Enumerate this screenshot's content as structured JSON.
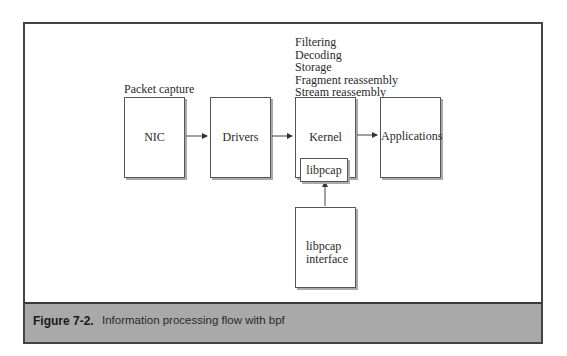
{
  "diagram": {
    "nodes": [
      {
        "id": "nic",
        "label": "NIC"
      },
      {
        "id": "drivers",
        "label": "Drivers"
      },
      {
        "id": "kernel",
        "label": "Kernel"
      },
      {
        "id": "applications",
        "label": "Applications"
      },
      {
        "id": "libpcap",
        "label": "libpcap"
      },
      {
        "id": "libpcap_interface",
        "label_lines": [
          "libpcap",
          "interface"
        ]
      }
    ],
    "edges": [
      {
        "from": "nic",
        "to": "drivers"
      },
      {
        "from": "drivers",
        "to": "kernel"
      },
      {
        "from": "kernel",
        "to": "applications"
      },
      {
        "from": "libpcap_interface",
        "to": "kernel"
      }
    ],
    "annotations": {
      "packet_capture": "Packet capture",
      "kernel_functions": [
        "Filtering",
        "Decoding",
        "Storage",
        "Fragment reassembly",
        "Stream reassembly"
      ]
    }
  },
  "caption": {
    "label": "Figure 7-2.",
    "text": "Information processing flow with bpf"
  }
}
